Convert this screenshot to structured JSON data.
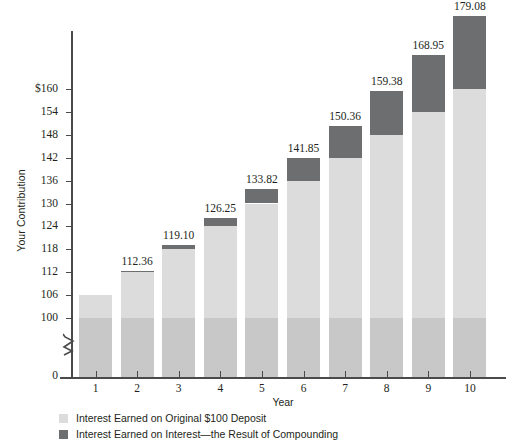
{
  "chart_data": {
    "type": "bar",
    "stacked": true,
    "title": "",
    "xlabel": "Year",
    "ylabel": "Your Contribution",
    "categories": [
      "1",
      "2",
      "3",
      "4",
      "5",
      "6",
      "7",
      "8",
      "9",
      "10"
    ],
    "value_labels": [
      "112.36",
      "119.10",
      "126.25",
      "133.82",
      "141.85",
      "150.36",
      "159.38",
      "168.95",
      "179.08"
    ],
    "values": [
      106.0,
      112.36,
      119.1,
      126.25,
      133.82,
      141.85,
      150.36,
      159.38,
      168.95,
      179.08
    ],
    "series": [
      {
        "name": "Interest Earned on Original $100 Deposit",
        "color": "#dcdcdc",
        "values": [
          106.0,
          112.0,
          118.0,
          124.0,
          130.0,
          136.0,
          142.0,
          148.0,
          154.0,
          160.0
        ]
      },
      {
        "name": "Interest Earned on Interest—the Result of Compounding",
        "color": "#6d6e70",
        "values": [
          0.0,
          0.36,
          1.1,
          2.25,
          3.82,
          5.85,
          8.36,
          11.38,
          14.95,
          19.08
        ]
      }
    ],
    "y_ticks": [
      "0",
      "100",
      "106",
      "112",
      "118",
      "124",
      "130",
      "136",
      "142",
      "148",
      "154",
      "$160"
    ],
    "y_tick_values": [
      0,
      100,
      106,
      112,
      118,
      124,
      130,
      136,
      142,
      148,
      154,
      160
    ],
    "ylim": [
      100,
      160
    ],
    "axis_break": true,
    "grid": false,
    "legend_position": "bottom-left",
    "bar_base_color": "#c8c8c8",
    "axis_color": "#4a4a4a"
  },
  "legend": {
    "items": [
      {
        "label": "Interest Earned on Original $100 Deposit",
        "color": "#dcdcdc"
      },
      {
        "label": "Interest Earned on Interest—the Result of Compounding",
        "color": "#6d6e70"
      }
    ]
  },
  "axis": {
    "x_title": "Year",
    "y_title": "Your Contribution"
  }
}
